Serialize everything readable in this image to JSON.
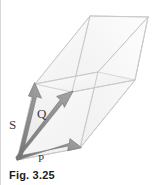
{
  "figure": {
    "caption": "Fig. 3.25",
    "type": "vector-parallelepiped-diagram",
    "background_color": "#ffffff",
    "vector_color": "#8c8c8c",
    "vector_outline_color": "#6e6e6e",
    "edge_color": "#d0d0d0",
    "face_fill_color": "#f4f4f4",
    "label_color": "#3b3b3b",
    "caption_color": "#1c1c1c",
    "vectors": [
      {
        "name": "S",
        "label": "S",
        "origin": [
          17,
          160
        ],
        "tip": [
          35,
          84
        ],
        "label_position": [
          9,
          118
        ]
      },
      {
        "name": "Q",
        "label": "Q",
        "origin": [
          17,
          160
        ],
        "tip": [
          72,
          92
        ],
        "label_position": [
          37,
          107
        ]
      },
      {
        "name": "P",
        "label": "P",
        "origin": [
          17,
          160
        ],
        "tip": [
          80,
          148
        ],
        "label_position": [
          38,
          153
        ]
      }
    ],
    "solid": {
      "description": "parallelepiped spanned by vectors P, Q and S",
      "origin_vertex": [
        17,
        160
      ],
      "vertices": {
        "O": [
          17,
          160
        ],
        "P": [
          80,
          148
        ],
        "Q": [
          72,
          92
        ],
        "S": [
          35,
          84
        ],
        "PQ": [
          135,
          80
        ],
        "PS": [
          98,
          72
        ],
        "QS": [
          90,
          16
        ],
        "PQS": [
          148,
          17
        ]
      }
    }
  }
}
